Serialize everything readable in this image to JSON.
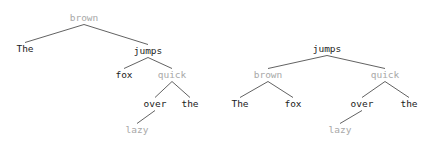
{
  "figure": {
    "type": "dependency-parse-trees",
    "background": "#ffffff",
    "colors": {
      "node_primary": "#1a1a1a",
      "node_muted": "#a8a8a8",
      "edge": "#3a3a3a"
    },
    "sentence_tokens": [
      "The",
      "brown",
      "fox",
      "jumps",
      "quick",
      "over",
      "the",
      "lazy"
    ]
  },
  "trees": [
    {
      "id": "left-tree",
      "name": "left-dependency-tree",
      "root": "brown",
      "has_root_self_arc": true,
      "nodes": [
        {
          "id": "l-brown",
          "label": "brown",
          "tone": "gray",
          "x": 84,
          "y": 13
        },
        {
          "id": "l-the1",
          "label": "The",
          "tone": "black",
          "x": 25,
          "y": 44
        },
        {
          "id": "l-jumps",
          "label": "jumps",
          "tone": "black",
          "x": 148,
          "y": 46
        },
        {
          "id": "l-fox",
          "label": "fox",
          "tone": "black",
          "x": 124,
          "y": 70
        },
        {
          "id": "l-quick",
          "label": "quick",
          "tone": "gray",
          "x": 172,
          "y": 70
        },
        {
          "id": "l-over",
          "label": "over",
          "tone": "black",
          "x": 155,
          "y": 99
        },
        {
          "id": "l-the2",
          "label": "the",
          "tone": "black",
          "x": 190,
          "y": 99
        },
        {
          "id": "l-lazy",
          "label": "lazy",
          "tone": "gray",
          "x": 137,
          "y": 125
        }
      ],
      "edges": [
        {
          "from": "l-brown",
          "to": "l-the1"
        },
        {
          "from": "l-brown",
          "to": "l-jumps"
        },
        {
          "from": "l-jumps",
          "to": "l-fox"
        },
        {
          "from": "l-jumps",
          "to": "l-quick"
        },
        {
          "from": "l-quick",
          "to": "l-over"
        },
        {
          "from": "l-quick",
          "to": "l-the2"
        },
        {
          "from": "l-over",
          "to": "l-lazy"
        }
      ]
    },
    {
      "id": "right-tree",
      "name": "right-dependency-tree",
      "root": "jumps",
      "has_root_self_arc": false,
      "nodes": [
        {
          "id": "r-jumps",
          "label": "jumps",
          "tone": "black",
          "x": 327,
          "y": 44
        },
        {
          "id": "r-brown",
          "label": "brown",
          "tone": "gray",
          "x": 268,
          "y": 70
        },
        {
          "id": "r-quick",
          "label": "quick",
          "tone": "gray",
          "x": 385,
          "y": 70
        },
        {
          "id": "r-the1",
          "label": "The",
          "tone": "black",
          "x": 240,
          "y": 99
        },
        {
          "id": "r-fox",
          "label": "fox",
          "tone": "black",
          "x": 293,
          "y": 99
        },
        {
          "id": "r-over",
          "label": "over",
          "tone": "black",
          "x": 362,
          "y": 99
        },
        {
          "id": "r-the2",
          "label": "the",
          "tone": "black",
          "x": 409,
          "y": 99
        },
        {
          "id": "r-lazy",
          "label": "lazy",
          "tone": "gray",
          "x": 340,
          "y": 125
        }
      ],
      "edges": [
        {
          "from": "r-jumps",
          "to": "r-brown"
        },
        {
          "from": "r-jumps",
          "to": "r-quick"
        },
        {
          "from": "r-brown",
          "to": "r-the1"
        },
        {
          "from": "r-brown",
          "to": "r-fox"
        },
        {
          "from": "r-quick",
          "to": "r-over"
        },
        {
          "from": "r-quick",
          "to": "r-the2"
        },
        {
          "from": "r-over",
          "to": "r-lazy"
        }
      ]
    }
  ]
}
